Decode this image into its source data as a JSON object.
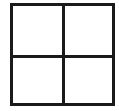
{
  "grid": {
    "rows": 2,
    "columns": 2,
    "line_color": "#1a1a1a",
    "background": "#ffffff",
    "cells": [
      {
        "row": 0,
        "col": 0,
        "content": ""
      },
      {
        "row": 0,
        "col": 1,
        "content": ""
      },
      {
        "row": 1,
        "col": 0,
        "content": ""
      },
      {
        "row": 1,
        "col": 1,
        "content": ""
      }
    ]
  }
}
